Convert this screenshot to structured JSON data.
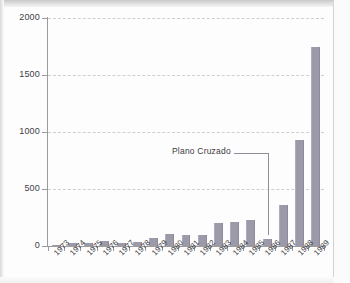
{
  "chart_data": {
    "type": "bar",
    "title": "",
    "subtitle": "",
    "xlabel": "",
    "ylabel": "",
    "ylim": [
      0,
      2000
    ],
    "yticks": [
      0,
      500,
      1000,
      1500,
      2000
    ],
    "ytick_labels": [
      "0",
      "500",
      "1000",
      "1500",
      "2000"
    ],
    "grid": true,
    "legend": null,
    "bar_color": "#9c99a9",
    "categories": [
      "1973",
      "1974",
      "1975",
      "1976",
      "1977",
      "1978",
      "1979",
      "1980",
      "1981",
      "1982",
      "1983",
      "1984",
      "1985",
      "1986",
      "1987",
      "1988",
      "1989"
    ],
    "values": [
      12,
      28,
      24,
      42,
      30,
      33,
      70,
      105,
      95,
      96,
      205,
      215,
      225,
      60,
      360,
      930,
      1750
    ],
    "annotations": [
      {
        "text": "Plano Cruzado",
        "points_to_category": "1986",
        "leader": "horizontal-then-vertical"
      }
    ]
  },
  "axis": {
    "y_tick_labels": [
      "2000",
      "1500",
      "1000",
      "500",
      "0"
    ]
  },
  "annotation": {
    "label": "Plano Cruzado"
  }
}
